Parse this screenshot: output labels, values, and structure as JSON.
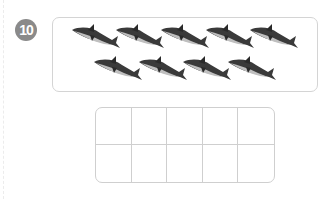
{
  "problem": {
    "number": "10",
    "badge_color": "#8a8a8a"
  },
  "picture": {
    "object": "shark",
    "count": 9,
    "rows": [
      5,
      4
    ],
    "shark_color": "#3a3a3a"
  },
  "ten_frame": {
    "rows": 2,
    "columns": 5,
    "cells": [
      "",
      "",
      "",
      "",
      "",
      "",
      "",
      "",
      "",
      ""
    ]
  }
}
